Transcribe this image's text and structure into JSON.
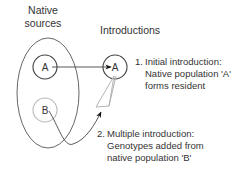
{
  "headings": {
    "native_line1": "Native",
    "native_line2": "sources",
    "introductions": "Introductions"
  },
  "nodes": {
    "native_a": "A",
    "native_b": "B",
    "introduced_a": "A"
  },
  "annotations": {
    "step1": {
      "number": "1.",
      "line1": "Initial introduction:",
      "line2": "Native population 'A'",
      "line3": "forms resident"
    },
    "step2": {
      "number": "2.",
      "line1": "Multiple introduction:",
      "line2": "Genotypes added from",
      "line3": "native population 'B'"
    }
  },
  "colors": {
    "dark_stroke": "#444444",
    "light_stroke": "#bbbbbb",
    "text": "#333333",
    "arrow": "#111111"
  }
}
